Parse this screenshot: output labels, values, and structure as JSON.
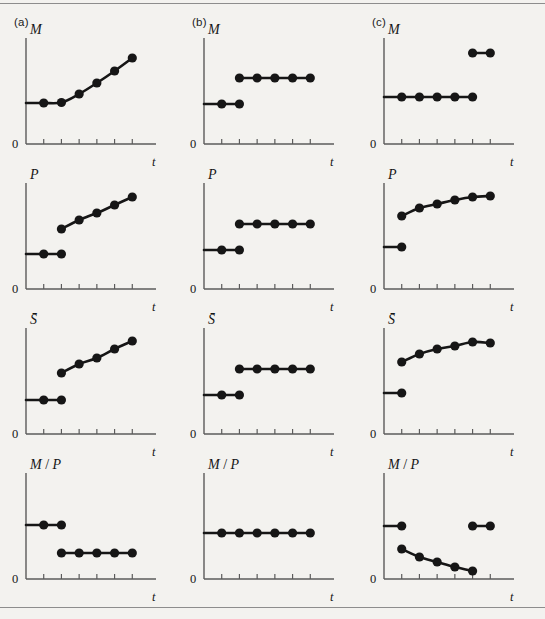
{
  "figure": {
    "background_color": "#f3f2ef",
    "ink_color": "#161616",
    "axis_color": "#5b5b5b",
    "rule_color": "#8d8d8d",
    "columns": [
      {
        "id": "a",
        "label": "(a)"
      },
      {
        "id": "b",
        "label": "(b)"
      },
      {
        "id": "c",
        "label": "(c)"
      }
    ],
    "rows": [
      {
        "id": "M",
        "ylabel": "M"
      },
      {
        "id": "P",
        "ylabel": "P"
      },
      {
        "id": "S",
        "ylabel": "S̄"
      },
      {
        "id": "MP",
        "ylabel": "M / P"
      }
    ],
    "axis": {
      "origin_label": "0",
      "xlabel": "t",
      "tick_count": 6
    }
  },
  "chart_data": [
    {
      "id": "a-M",
      "type": "line",
      "title": "(a) M",
      "ylabel": "M",
      "xlabel": "t",
      "xlim": [
        0,
        7
      ],
      "ylim": [
        0,
        10
      ],
      "grid": false,
      "legend": "none",
      "annotation": "continuous: flat then accelerating growth",
      "segments": [
        {
          "name": "path",
          "x": [
            1,
            2,
            3,
            4,
            5,
            6
          ],
          "y": [
            4.1,
            4.15,
            5.0,
            6.1,
            7.3,
            8.6
          ],
          "connected_to_axis": true,
          "axis_y": 4.1
        }
      ]
    },
    {
      "id": "a-P",
      "type": "line",
      "title": "(a) P",
      "ylabel": "P",
      "xlabel": "t",
      "xlim": [
        0,
        7
      ],
      "ylim": [
        0,
        10
      ],
      "grid": false,
      "legend": "none",
      "annotation": "flat, then discrete jump up and steady rise",
      "segments": [
        {
          "name": "before",
          "x": [
            1,
            2
          ],
          "y": [
            3.5,
            3.5
          ],
          "connected_to_axis": true,
          "axis_y": 3.5
        },
        {
          "name": "after",
          "x": [
            2,
            3,
            4,
            5,
            6
          ],
          "y": [
            6.0,
            6.9,
            7.6,
            8.4,
            9.2
          ],
          "connected_to_axis": false
        }
      ]
    },
    {
      "id": "a-S",
      "type": "line",
      "title": "(a) S-bar",
      "ylabel": "S̄",
      "xlabel": "t",
      "xlim": [
        0,
        7
      ],
      "ylim": [
        0,
        10
      ],
      "grid": false,
      "legend": "none",
      "annotation": "flat, then discrete jump up and steady rise",
      "segments": [
        {
          "name": "before",
          "x": [
            1,
            2
          ],
          "y": [
            3.4,
            3.4
          ],
          "connected_to_axis": true,
          "axis_y": 3.4
        },
        {
          "name": "after",
          "x": [
            2,
            3,
            4,
            5,
            6
          ],
          "y": [
            6.1,
            7.0,
            7.6,
            8.5,
            9.3
          ],
          "connected_to_axis": false
        }
      ]
    },
    {
      "id": "a-MP",
      "type": "line",
      "title": "(a) M / P",
      "ylabel": "M / P",
      "xlabel": "t",
      "xlim": [
        0,
        7
      ],
      "ylim": [
        0,
        10
      ],
      "grid": false,
      "legend": "none",
      "annotation": "high flat level, then drop to a lower constant level",
      "segments": [
        {
          "name": "before",
          "x": [
            1,
            2
          ],
          "y": [
            5.4,
            5.4
          ],
          "connected_to_axis": true,
          "axis_y": 5.4
        },
        {
          "name": "after",
          "x": [
            2,
            3,
            4,
            5,
            6
          ],
          "y": [
            2.6,
            2.6,
            2.6,
            2.6,
            2.6
          ],
          "connected_to_axis": false
        }
      ]
    },
    {
      "id": "b-M",
      "type": "line",
      "title": "(b) M",
      "ylabel": "M",
      "xlabel": "t",
      "xlim": [
        0,
        7
      ],
      "ylim": [
        0,
        10
      ],
      "grid": false,
      "legend": "none",
      "annotation": "one-off step increase then constant",
      "segments": [
        {
          "name": "before",
          "x": [
            1,
            2
          ],
          "y": [
            4.0,
            4.0
          ],
          "connected_to_axis": true,
          "axis_y": 4.0
        },
        {
          "name": "after",
          "x": [
            2,
            3,
            4,
            5,
            6
          ],
          "y": [
            6.6,
            6.6,
            6.6,
            6.6,
            6.6
          ],
          "connected_to_axis": false
        }
      ]
    },
    {
      "id": "b-P",
      "type": "line",
      "title": "(b) P",
      "ylabel": "P",
      "xlabel": "t",
      "xlim": [
        0,
        7
      ],
      "ylim": [
        0,
        10
      ],
      "grid": false,
      "legend": "none",
      "annotation": "one-off step increase then constant",
      "segments": [
        {
          "name": "before",
          "x": [
            1,
            2
          ],
          "y": [
            3.9,
            3.9
          ],
          "connected_to_axis": true,
          "axis_y": 3.9
        },
        {
          "name": "after",
          "x": [
            2,
            3,
            4,
            5,
            6
          ],
          "y": [
            6.5,
            6.5,
            6.5,
            6.5,
            6.5
          ],
          "connected_to_axis": false
        }
      ]
    },
    {
      "id": "b-S",
      "type": "line",
      "title": "(b) S-bar",
      "ylabel": "S̄",
      "xlabel": "t",
      "xlim": [
        0,
        7
      ],
      "ylim": [
        0,
        10
      ],
      "grid": false,
      "legend": "none",
      "annotation": "one-off step increase then constant",
      "segments": [
        {
          "name": "before",
          "x": [
            1,
            2
          ],
          "y": [
            3.9,
            3.9
          ],
          "connected_to_axis": true,
          "axis_y": 3.9
        },
        {
          "name": "after",
          "x": [
            2,
            3,
            4,
            5,
            6
          ],
          "y": [
            6.5,
            6.5,
            6.5,
            6.5,
            6.5
          ],
          "connected_to_axis": false
        }
      ]
    },
    {
      "id": "b-MP",
      "type": "line",
      "title": "(b) M / P",
      "ylabel": "M / P",
      "xlabel": "t",
      "xlim": [
        0,
        7
      ],
      "ylim": [
        0,
        10
      ],
      "grid": false,
      "legend": "none",
      "annotation": "unchanged throughout",
      "segments": [
        {
          "name": "path",
          "x": [
            1,
            2,
            3,
            4,
            5,
            6
          ],
          "y": [
            4.6,
            4.6,
            4.6,
            4.6,
            4.6,
            4.6
          ],
          "connected_to_axis": true,
          "axis_y": 4.6
        }
      ]
    },
    {
      "id": "c-M",
      "type": "line",
      "title": "(c) M",
      "ylabel": "M",
      "xlabel": "t",
      "xlim": [
        0,
        7
      ],
      "ylim": [
        0,
        10
      ],
      "grid": false,
      "legend": "none",
      "annotation": "constant, then a late jump to a higher level",
      "segments": [
        {
          "name": "before",
          "x": [
            1,
            2,
            3,
            4,
            5
          ],
          "y": [
            4.7,
            4.7,
            4.7,
            4.7,
            4.7
          ],
          "connected_to_axis": true,
          "axis_y": 4.7
        },
        {
          "name": "after",
          "x": [
            5,
            6
          ],
          "y": [
            9.1,
            9.1
          ],
          "connected_to_axis": false
        }
      ]
    },
    {
      "id": "c-P",
      "type": "line",
      "title": "(c) P",
      "ylabel": "P",
      "xlabel": "t",
      "xlim": [
        0,
        7
      ],
      "ylim": [
        0,
        10
      ],
      "grid": false,
      "legend": "none",
      "annotation": "flat, then jump and concave rise flattening out",
      "segments": [
        {
          "name": "before",
          "x": [
            1
          ],
          "y": [
            4.2
          ],
          "connected_to_axis": true,
          "axis_y": 4.2
        },
        {
          "name": "after",
          "x": [
            1,
            2,
            3,
            4,
            5,
            6
          ],
          "y": [
            7.3,
            8.1,
            8.5,
            8.9,
            9.2,
            9.3
          ],
          "connected_to_axis": false
        }
      ]
    },
    {
      "id": "c-S",
      "type": "line",
      "title": "(c) S-bar",
      "ylabel": "S̄",
      "xlabel": "t",
      "xlim": [
        0,
        7
      ],
      "ylim": [
        0,
        10
      ],
      "grid": false,
      "legend": "none",
      "annotation": "flat, then jump and concave rise flattening out",
      "segments": [
        {
          "name": "before",
          "x": [
            1
          ],
          "y": [
            4.1
          ],
          "connected_to_axis": true,
          "axis_y": 4.1
        },
        {
          "name": "after",
          "x": [
            1,
            2,
            3,
            4,
            5,
            6
          ],
          "y": [
            7.2,
            8.0,
            8.5,
            8.8,
            9.2,
            9.1
          ],
          "connected_to_axis": false
        }
      ]
    },
    {
      "id": "c-MP",
      "type": "line",
      "title": "(c) M / P",
      "ylabel": "M / P",
      "xlabel": "t",
      "xlim": [
        0,
        7
      ],
      "ylim": [
        0,
        10
      ],
      "grid": false,
      "legend": "none",
      "annotation": "drops below trend, decays toward zero, then returns to the original level",
      "segments": [
        {
          "name": "before",
          "x": [
            1
          ],
          "y": [
            5.3
          ],
          "connected_to_axis": true,
          "axis_y": 5.3
        },
        {
          "name": "decay",
          "x": [
            1,
            2,
            3,
            4,
            5
          ],
          "y": [
            3.0,
            2.2,
            1.7,
            1.2,
            0.8
          ],
          "connected_to_axis": false
        },
        {
          "name": "after",
          "x": [
            5,
            6
          ],
          "y": [
            5.3,
            5.3
          ],
          "connected_to_axis": false
        }
      ]
    }
  ]
}
